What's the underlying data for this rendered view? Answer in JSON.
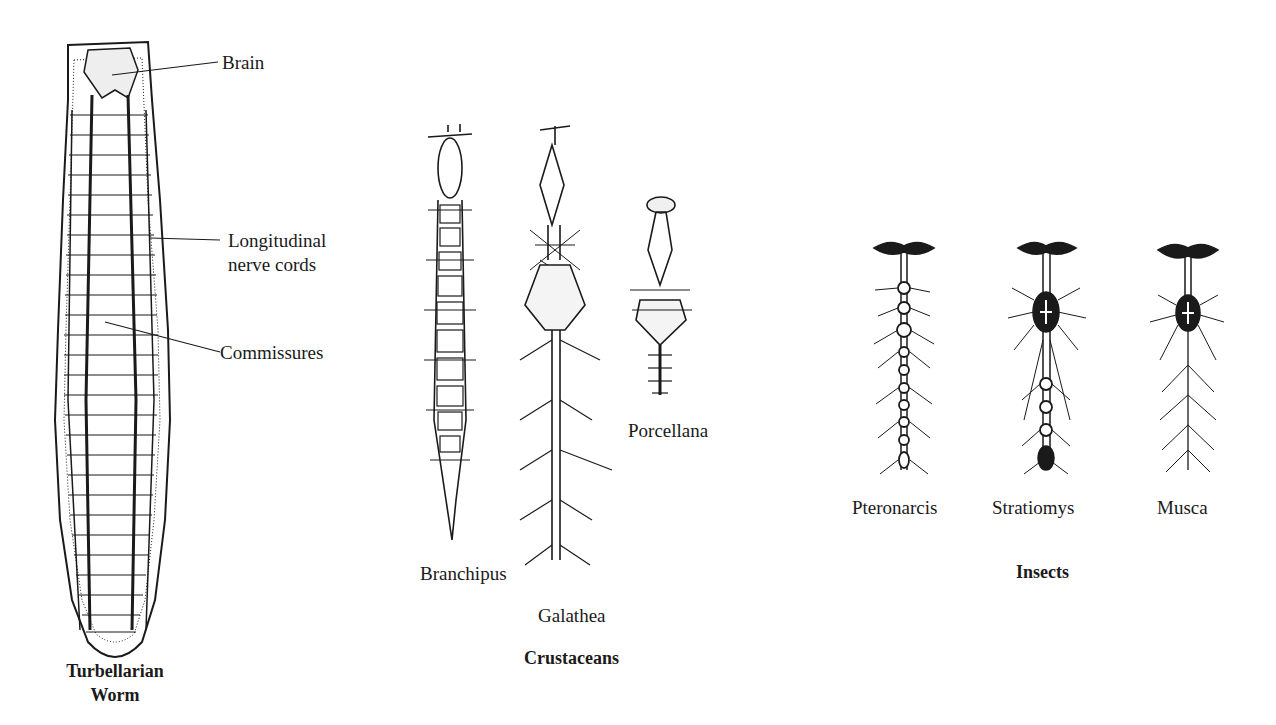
{
  "figure": {
    "turbellarian": {
      "title_line1": "Turbellarian",
      "title_line2": "Worm",
      "callouts": {
        "brain": "Brain",
        "cords_line1": "Longitudinal",
        "cords_line2": "nerve cords",
        "commissures": "Commissures"
      }
    },
    "crustaceans": {
      "group_label": "Crustaceans",
      "species": [
        "Branchipus",
        "Galathea",
        "Porcellana"
      ]
    },
    "insects": {
      "group_label": "Insects",
      "species": [
        "Pteronarcis",
        "Stratiomys",
        "Musca"
      ]
    }
  },
  "colors": {
    "ink": "#1a1a1a",
    "background": "#ffffff"
  }
}
